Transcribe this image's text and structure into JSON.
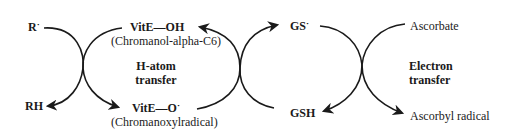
{
  "diagram": {
    "left_cycle": {
      "reactant": "R",
      "reactant_radical_mark": "·",
      "product": "RH"
    },
    "vit_e": {
      "reduced": {
        "formula_prefix": "VitE",
        "bond": "—",
        "formula_suffix": "OH",
        "name": "(Chromanol-alpha-C6)"
      },
      "oxidized": {
        "formula_prefix": "VitE",
        "bond": "—",
        "formula_suffix": "O",
        "radical_mark": "·",
        "name": "(Chromanoxylradical)"
      }
    },
    "h_atom_transfer": {
      "line1": "H-atom",
      "line2": "transfer"
    },
    "glutathione": {
      "oxidized": "GS",
      "oxidized_radical_mark": "·",
      "reduced": "GSH"
    },
    "ascorbate": {
      "reduced": "Ascorbate",
      "oxidized": "Ascorbyl radical"
    },
    "electron_transfer": {
      "line1": "Electron",
      "line2": "transfer"
    },
    "colors": {
      "stroke": "#1a1a1a",
      "background": "#ffffff"
    }
  }
}
